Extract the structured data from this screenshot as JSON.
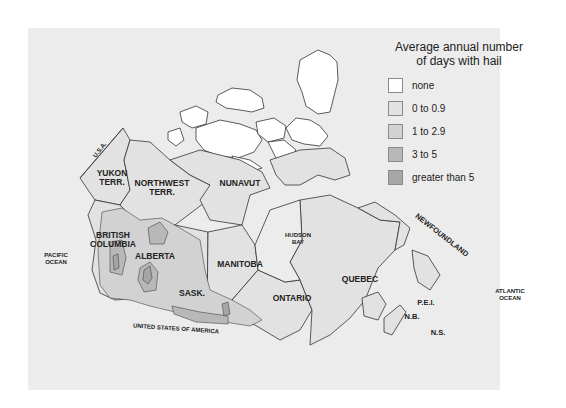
{
  "legend": {
    "title_line1": "Average annual number",
    "title_line2": "of days with hail",
    "items": [
      {
        "label": "none",
        "color": "#ffffff"
      },
      {
        "label": "0 to 0.9",
        "color": "#e2e2e2"
      },
      {
        "label": "1 to 2.9",
        "color": "#d2d2d2"
      },
      {
        "label": "3 to 5",
        "color": "#b8b8b8"
      },
      {
        "label": "greater than 5",
        "color": "#a6a6a6"
      }
    ]
  },
  "labels": {
    "usa_alaska": "U.S.A.",
    "yukon_1": "YUKON",
    "yukon_2": "TERR.",
    "nwt_1": "NORTHWEST",
    "nwt_2": "TERR.",
    "nunavut": "NUNAVUT",
    "bc_1": "BRITISH",
    "bc_2": "COLUMBIA",
    "alberta": "ALBERTA",
    "sask": "SASK.",
    "manitoba": "MANITOBA",
    "ontario": "ONTARIO",
    "quebec": "QUEBEC",
    "hudson_1": "HUDSON",
    "hudson_2": "BAY",
    "newfoundland": "NEWFOUNDLAND",
    "pei": "P.E.I.",
    "nb": "N.B.",
    "ns": "N.S.",
    "pacific_1": "PACIFIC",
    "pacific_2": "OCEAN",
    "atlantic_1": "ATLANTIC",
    "atlantic_2": "OCEAN",
    "usa": "UNITED STATES OF AMERICA"
  },
  "colors": {
    "panel_bg": "#ececec",
    "land_low": "#e2e2e2",
    "zone_mid": "#d2d2d2",
    "zone_high": "#b8b8b8",
    "zone_max": "#a6a6a6",
    "outline": "#333333"
  }
}
